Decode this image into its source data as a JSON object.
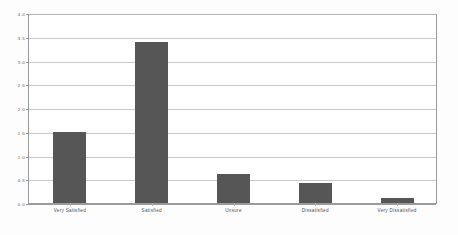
{
  "chart_data": {
    "type": "bar",
    "title": "",
    "subtitle": "",
    "xlabel": "",
    "ylabel": "",
    "categories": [
      "Very Satisfied",
      "Satisfied",
      "Unsure",
      "Dissatisfied",
      "Very Dissatisfied"
    ],
    "values": [
      1.5,
      3.4,
      0.62,
      0.42,
      0.1
    ],
    "ylim": [
      0.0,
      4.0
    ],
    "yticks": [
      0.0,
      0.5,
      1.0,
      1.5,
      2.0,
      2.5,
      3.0,
      3.5,
      4.0
    ],
    "ytick_labels": [
      "0.0",
      "0.5",
      "1.0",
      "1.5",
      "2.0",
      "2.5",
      "3.0",
      "3.5",
      "4.0"
    ],
    "grid": true,
    "legend": false,
    "legend_position": "none",
    "bar_color": "#565656",
    "gridline_color": "#c9c9c9",
    "axis_color": "#9a9a9a",
    "background_color": "#ffffff",
    "page_background_color": "#fdfdfd",
    "tick_label_color": "#5a5a5a"
  }
}
